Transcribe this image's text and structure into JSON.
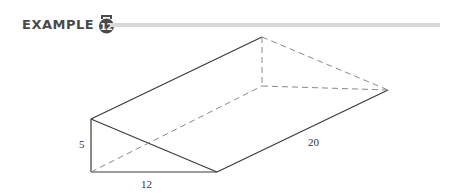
{
  "header": {
    "label": "EXAMPLE",
    "number": "12",
    "badge_icon": "example-badge-icon",
    "badge_color": "#4a4a4a",
    "rule_color": "#d9d9d9"
  },
  "figure": {
    "type": "triangular-prism",
    "labels": {
      "height": "5",
      "base": "12",
      "length": "20"
    },
    "vertices": {
      "front_top": [
        91,
        119
      ],
      "front_bottom_left": [
        91,
        172
      ],
      "front_bottom_right": [
        217,
        172
      ],
      "back_top": [
        262,
        37
      ],
      "back_bottom_left": [
        262,
        86
      ],
      "back_bottom_right": [
        388,
        90
      ]
    }
  }
}
